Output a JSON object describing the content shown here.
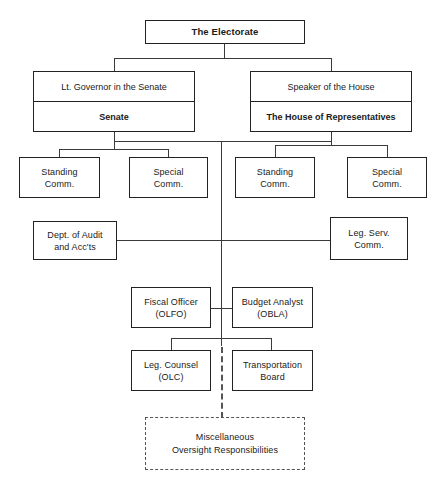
{
  "diagram": {
    "type": "organizational-chart",
    "background": "#ffffff",
    "line_color": "#3a3a3a",
    "box_border_color": "#222222",
    "dashed_border_color": "#555555"
  },
  "nodes": {
    "electorate": {
      "label": "The Electorate"
    },
    "senate_group": {
      "head": "Lt. Governor in the Senate",
      "body": "Senate"
    },
    "house_group": {
      "head": "Speaker of the House",
      "body": "The House of Representatives"
    },
    "senate_standing": {
      "line1": "Standing",
      "line2": "Comm."
    },
    "senate_special": {
      "line1": "Special",
      "line2": "Comm."
    },
    "house_standing": {
      "line1": "Standing",
      "line2": "Comm."
    },
    "house_special": {
      "line1": "Special",
      "line2": "Comm."
    },
    "audit": {
      "line1": "Dept. of Audit",
      "line2": "and Acc'ts"
    },
    "leg_serv": {
      "line1": "Leg. Serv.",
      "line2": "Comm."
    },
    "fiscal_officer": {
      "line1": "Fiscal Officer",
      "line2": "(OLFO)"
    },
    "budget_analyst": {
      "line1": "Budget Analyst",
      "line2": "(OBLA)"
    },
    "leg_counsel": {
      "line1": "Leg. Counsel",
      "line2": "(OLC)"
    },
    "transportation_board": {
      "line1": "Transportation",
      "line2": "Board"
    },
    "misc_oversight": {
      "line1": "Miscellaneous",
      "line2": "Oversight Responsibilities"
    }
  }
}
